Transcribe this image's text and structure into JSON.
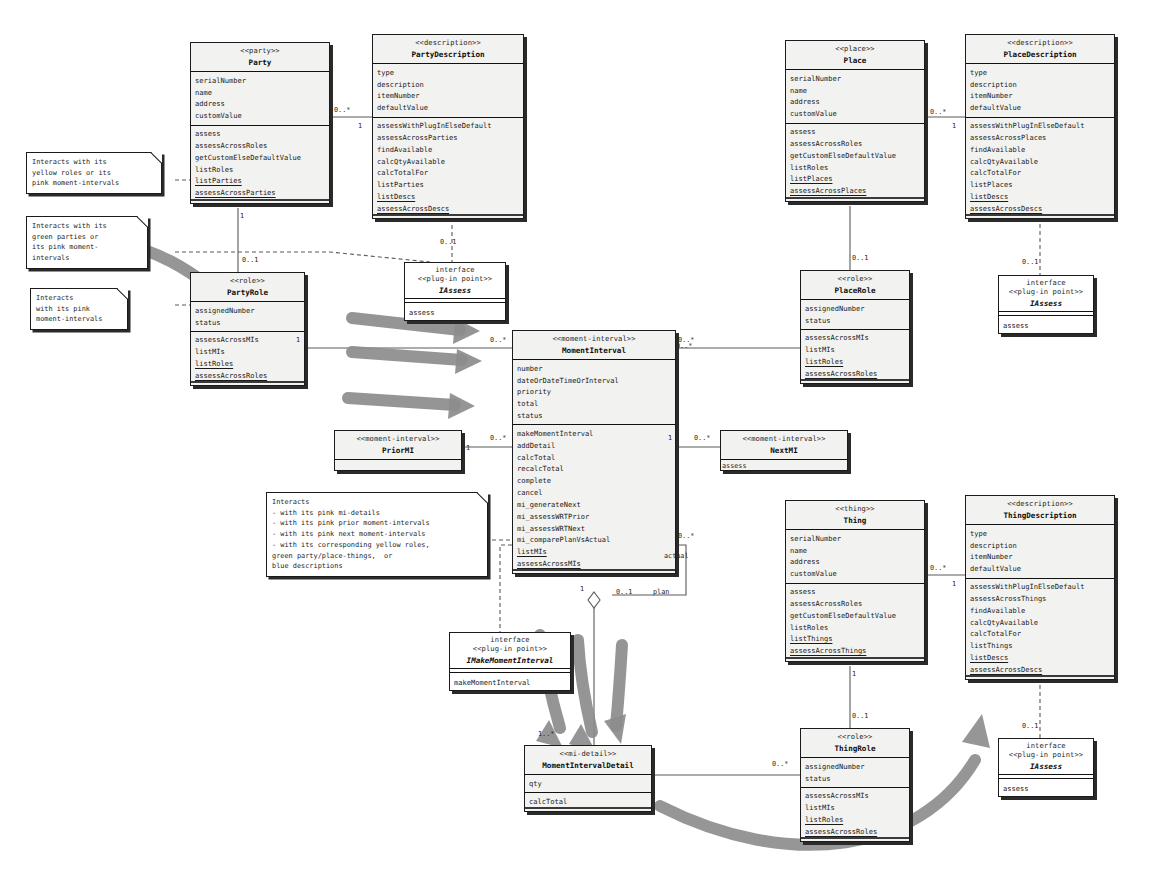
{
  "diagram": {
    "accent": "#808080",
    "line_color": "#555555",
    "box_fill": "#f2f2f0"
  },
  "classes": {
    "party": {
      "stereotype": "<<party>>",
      "name": "Party",
      "attributes": [
        "serialNumber",
        "name",
        "address",
        "customValue"
      ],
      "operations": [
        "assess",
        "assessAcrossRoles",
        "getCustomElseDefaultValue",
        "listRoles",
        "listParties",
        "assessAcrossParties"
      ]
    },
    "party_description": {
      "stereotype": "<<description>>",
      "name": "PartyDescription",
      "attributes": [
        "type",
        "description",
        "itemNumber",
        "defaultValue"
      ],
      "operations": [
        "assessWithPlugInElseDefault",
        "assessAcrossParties",
        "findAvailable",
        "calcQtyAvailable",
        "calcTotalFor",
        "listParties",
        "listDescs",
        "assessAcrossDescs"
      ]
    },
    "party_role": {
      "stereotype": "<<role>>",
      "name": "PartyRole",
      "attributes": [
        "assignedNumber",
        "status"
      ],
      "operations": [
        "assessAcrossMIs",
        "listMIs",
        "listRoles",
        "assessAcrossRoles"
      ]
    },
    "place": {
      "stereotype": "<<place>>",
      "name": "Place",
      "attributes": [
        "serialNumber",
        "name",
        "address",
        "customValue"
      ],
      "operations": [
        "assess",
        "assessAcrossRoles",
        "getCustomElseDefaultValue",
        "listRoles",
        "listPlaces",
        "assessAcrossPlaces"
      ]
    },
    "place_description": {
      "stereotype": "<<description>>",
      "name": "PlaceDescription",
      "attributes": [
        "type",
        "description",
        "itemNumber",
        "defaultValue"
      ],
      "operations": [
        "assessWithPlugInElseDefault",
        "assessAcrossPlaces",
        "findAvailable",
        "calcQtyAvailable",
        "calcTotalFor",
        "listPlaces",
        "listDescs",
        "assessAcrossDescs"
      ]
    },
    "place_role": {
      "stereotype": "<<role>>",
      "name": "PlaceRole",
      "attributes": [
        "assignedNumber",
        "status"
      ],
      "operations": [
        "assessAcrossMIs",
        "listMIs",
        "listRoles",
        "assessAcrossRoles"
      ]
    },
    "thing": {
      "stereotype": "<<thing>>",
      "name": "Thing",
      "attributes": [
        "serialNumber",
        "name",
        "address",
        "customValue"
      ],
      "operations": [
        "assess",
        "assessAcrossRoles",
        "getCustomElseDefaultValue",
        "listRoles",
        "listThings",
        "assessAcrossThings"
      ]
    },
    "thing_description": {
      "stereotype": "<<description>>",
      "name": "ThingDescription",
      "attributes": [
        "type",
        "description",
        "itemNumber",
        "defaultValue"
      ],
      "operations": [
        "assessWithPlugInElseDefault",
        "assessAcrossThings",
        "findAvailable",
        "calcQtyAvailable",
        "calcTotalFor",
        "listThings",
        "listDescs",
        "assessAcrossDescs"
      ]
    },
    "thing_role": {
      "stereotype": "<<role>>",
      "name": "ThingRole",
      "attributes": [
        "assignedNumber",
        "status"
      ],
      "operations": [
        "assessAcrossMIs",
        "listMIs",
        "listRoles",
        "assessAcrossRoles"
      ]
    },
    "moment_interval": {
      "stereotype": "<<moment-interval>>",
      "name": "MomentInterval",
      "attributes": [
        "number",
        "dateOrDateTimeOrInterval",
        "priority",
        "total",
        "status"
      ],
      "operations": [
        "makeMomentInterval",
        "addDetail",
        "calcTotal",
        "recalcTotal",
        "complete",
        "cancel",
        "mi_generateNext",
        "mi_assessWRTPrior",
        "mi_assessWRTNext",
        "mi_comparePlanVsActual",
        "listMIs",
        "assessAcrossMIs"
      ]
    },
    "prior_mi": {
      "stereotype": "<<moment-interval>>",
      "name": "PriorMI",
      "attributes": [],
      "operations": []
    },
    "next_mi": {
      "stereotype": "<<moment-interval>>",
      "name": "NextMI",
      "attributes": [],
      "operations": []
    },
    "mi_detail": {
      "stereotype": "<<mi-detail>>",
      "name": "MomentIntervalDetail",
      "attributes": [
        "qty"
      ],
      "operations": [
        "calcTotal"
      ]
    }
  },
  "interfaces": {
    "iassess_party": {
      "kind": "interface",
      "stereotype": "<<plug-in point>>",
      "name": "IAssess",
      "operations": [
        "assess"
      ]
    },
    "iassess_place": {
      "kind": "interface",
      "stereotype": "<<plug-in point>>",
      "name": "IAssess",
      "operations": [
        "assess"
      ]
    },
    "iassess_thing": {
      "kind": "interface",
      "stereotype": "<<plug-in point>>",
      "name": "IAssess",
      "operations": [
        "assess"
      ]
    },
    "imake_mi": {
      "kind": "interface",
      "stereotype": "<<plug-in point>>",
      "name": "IMakeMomentInterval",
      "operations": [
        "makeMomentInterval"
      ]
    }
  },
  "notes": {
    "note_party": {
      "lines": [
        "Interacts with its",
        "yellow roles or its",
        "pink moment-intervals"
      ]
    },
    "note_party_role": {
      "lines": [
        "Interacts with its",
        "green parties or",
        "its pink moment-",
        "intervals"
      ]
    },
    "note_mi_small": {
      "lines": [
        "Interacts",
        "with its pink",
        "moment-intervals"
      ]
    },
    "note_mi_big": {
      "lines": [
        "Interacts",
        "- with its pink mi-details",
        "- with its pink prior moment-intervals",
        "- with its pink next moment-intervals",
        "- with its corresponding yellow roles,",
        "green party/place-things,  or",
        "blue descriptions"
      ]
    }
  },
  "edge_labels": {
    "party_to_desc_many": "0..*",
    "party_to_desc_one": "1",
    "party_to_role_one": "1",
    "party_role_to_mi_from": "1",
    "party_role_to_mi_to": "0..*",
    "party_desc_to_iface": "0..1",
    "place_to_desc_many": "0..*",
    "place_to_desc_one": "1",
    "place_to_role_one": "0..1",
    "place_desc_to_iface": "0..1",
    "place_role_to_mi": "0..*",
    "thing_to_desc_many": "0..*",
    "thing_to_desc_one": "1",
    "thing_to_role_one": "1",
    "thing_desc_to_iface": "0..1",
    "thing_role_to_detail": "0..*",
    "prior_mi_many": "0..*",
    "prior_mi_one": "1",
    "next_mi_one": "1",
    "next_mi_many": "0..*",
    "mi_to_detail_one": "1",
    "mi_to_detail_many": "1..*",
    "mi_actual_many": "0..*",
    "mi_plan_one": "0..1",
    "mi_actual_role": "actual",
    "mi_plan_role": "plan",
    "imake_mi_mult": "0..1",
    "iface_assess_op": "assess",
    "next_mi_assess_op": "assess"
  }
}
